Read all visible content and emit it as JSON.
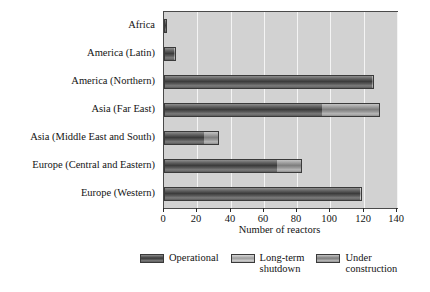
{
  "chart_data": {
    "type": "bar",
    "orientation": "horizontal",
    "stacked": true,
    "title": "",
    "xlabel": "Number of reactors",
    "ylabel": "",
    "xlim": [
      0,
      140
    ],
    "xticks": [
      0,
      20,
      40,
      60,
      80,
      100,
      120,
      140
    ],
    "xtick_labels": [
      "0",
      "20",
      "40",
      "60",
      "80",
      "100",
      "120",
      "140"
    ],
    "grid": "vertical-white-gridlines",
    "legend_position": "bottom",
    "categories": [
      "Africa",
      "America (Latin)",
      "America (Northern)",
      "Asia (Far East)",
      "Asia (Middle East and South)",
      "Europe (Central and Eastern)",
      "Europe (Western)"
    ],
    "series": [
      {
        "name": "Operational",
        "color": "#3b3b3b",
        "values": [
          2,
          6,
          125,
          95,
          24,
          68,
          118
        ]
      },
      {
        "name": "Long-term shutdown",
        "color": "#9e9e9e",
        "values": [
          0,
          0,
          0,
          0,
          0,
          0,
          1
        ]
      },
      {
        "name": "Under construction",
        "color": "#7e7e7e",
        "values": [
          0,
          1,
          1,
          35,
          9,
          15,
          0
        ]
      }
    ],
    "totals": [
      2,
      7,
      126,
      130,
      33,
      83,
      119
    ]
  },
  "axis": {
    "x_title": "Number of reactors"
  },
  "legend": {
    "items": [
      {
        "label": "Operational",
        "swatch": "operational-swatch"
      },
      {
        "label": "Long-term\nshutdown",
        "swatch": "shutdown-swatch"
      },
      {
        "label": "Under\nconstruction",
        "swatch": "under-construction-swatch"
      }
    ]
  },
  "colors": {
    "plot_background": "#d2d2d2",
    "gridline": "#f4f4f4",
    "frame": "#4a4a4a",
    "operational": "#3b3b3b",
    "shutdown": "#9e9e9e",
    "under_construction": "#7e7e7e",
    "text": "#131313"
  }
}
